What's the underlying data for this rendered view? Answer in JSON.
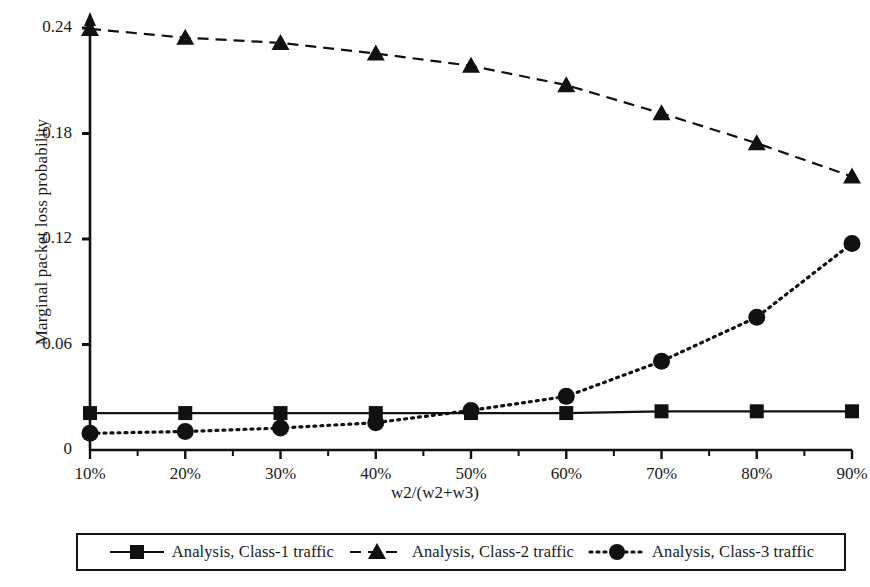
{
  "chart_data": {
    "type": "line",
    "title": "",
    "xlabel": "w2/(w2+w3)",
    "ylabel": "Marginal packet loss probability",
    "categories": [
      "10%",
      "20%",
      "30%",
      "40%",
      "50%",
      "60%",
      "70%",
      "80%",
      "90%"
    ],
    "x_tick_labels": [
      "10%",
      "20%",
      "30%",
      "40%",
      "50%",
      "60%",
      "70%",
      "80%",
      "90%"
    ],
    "y_tick_labels": [
      "0",
      "0.06",
      "0.12",
      "0.18",
      "0.24"
    ],
    "y_tick_values": [
      0,
      0.06,
      0.12,
      0.18,
      0.24
    ],
    "ylim": [
      0,
      0.24
    ],
    "grid": false,
    "legend_position": "bottom",
    "series": [
      {
        "name": "Analysis, Class-1 traffic",
        "marker": "square",
        "linestyle": "solid",
        "color": "#111111",
        "values": [
          0.021,
          0.021,
          0.021,
          0.021,
          0.021,
          0.021,
          0.022,
          0.022,
          0.022
        ]
      },
      {
        "name": "Analysis, Class-2 traffic",
        "marker": "triangle",
        "linestyle": "dashed",
        "color": "#111111",
        "values": [
          0.2395,
          0.2345,
          0.2315,
          0.2255,
          0.2185,
          0.2075,
          0.1915,
          0.1745,
          0.1555
        ]
      },
      {
        "name": "Analysis, Class-3 traffic",
        "marker": "circle",
        "linestyle": "dotted",
        "color": "#111111",
        "values": [
          0.0095,
          0.0105,
          0.0125,
          0.0155,
          0.0225,
          0.0305,
          0.0505,
          0.0755,
          0.1175
        ]
      }
    ]
  },
  "legend": {
    "items": [
      {
        "label": "Analysis, Class-1 traffic",
        "marker": "square-marker-icon",
        "linestyle": "solid"
      },
      {
        "label": "Analysis, Class-2 traffic",
        "marker": "triangle-marker-icon",
        "linestyle": "dashed"
      },
      {
        "label": "Analysis, Class-3 traffic",
        "marker": "circle-marker-icon",
        "linestyle": "dotted"
      }
    ]
  },
  "axes": {
    "x_title": "w2/(w2+w3)",
    "y_title": "Marginal packet loss probability"
  }
}
